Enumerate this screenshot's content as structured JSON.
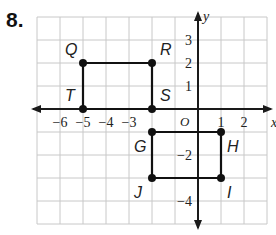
{
  "problem": {
    "number": "8."
  },
  "grid": {
    "x_min": -7,
    "x_max": 3,
    "y_min": -5,
    "y_max": 4,
    "origin_px": [
      198,
      109
    ],
    "unit_px": 23
  },
  "axes": {
    "x_label": "x",
    "y_label": "y",
    "origin_label": "O",
    "x_ticks": [
      {
        "v": -6,
        "t": "−6"
      },
      {
        "v": -5,
        "t": "−5"
      },
      {
        "v": -4,
        "t": "−4"
      },
      {
        "v": -3,
        "t": "−3"
      },
      {
        "v": 1,
        "t": "1"
      },
      {
        "v": 2,
        "t": "2"
      }
    ],
    "y_ticks": [
      {
        "v": 3,
        "t": "3"
      },
      {
        "v": 2,
        "t": "2"
      },
      {
        "v": 1,
        "t": "1"
      },
      {
        "v": -2,
        "t": "−2"
      },
      {
        "v": -4,
        "t": "−4"
      }
    ]
  },
  "shapes": [
    {
      "name": "QRST",
      "points": [
        {
          "label": "Q",
          "x": -5,
          "y": 2,
          "lx": -18,
          "ly": -8
        },
        {
          "label": "R",
          "x": -2,
          "y": 2,
          "lx": 8,
          "ly": -8
        },
        {
          "label": "S",
          "x": -2,
          "y": 0,
          "lx": 8,
          "ly": -8
        },
        {
          "label": "T",
          "x": -5,
          "y": 0,
          "lx": -18,
          "ly": -8
        }
      ]
    },
    {
      "name": "GHIJ",
      "points": [
        {
          "label": "G",
          "x": -2,
          "y": -1,
          "lx": -18,
          "ly": 20
        },
        {
          "label": "H",
          "x": 1,
          "y": -1,
          "lx": 6,
          "ly": 20
        },
        {
          "label": "I",
          "x": 1,
          "y": -3,
          "lx": 6,
          "ly": 20
        },
        {
          "label": "J",
          "x": -2,
          "y": -3,
          "lx": -18,
          "ly": 20
        }
      ]
    }
  ],
  "colors": {
    "grid": "#c8c8c8",
    "axis": "#1a1a1a",
    "shape": "#111111",
    "text": "#222222"
  }
}
